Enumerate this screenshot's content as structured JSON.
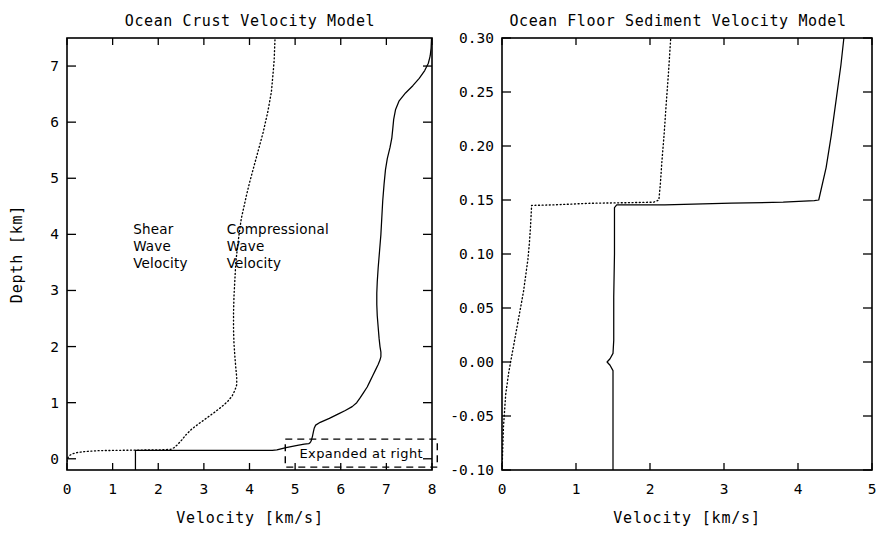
{
  "figure": {
    "background_color": "#ffffff",
    "ink_color": "#000000"
  },
  "chart_data": [
    {
      "id": "ocean-crust",
      "type": "line",
      "title": "Ocean Crust Velocity Model",
      "xlabel": "Velocity  [km/s]",
      "ylabel": "Depth  [km]",
      "xlim": [
        0,
        8
      ],
      "ylim": [
        7.5,
        -0.2
      ],
      "y_inverted": true,
      "grid": false,
      "legend_position": "in-plot-annotations",
      "xticks": [
        0,
        1,
        2,
        3,
        4,
        5,
        6,
        7,
        8
      ],
      "xtick_labels": [
        "0",
        "1",
        "2",
        "3",
        "4",
        "5",
        "6",
        "7",
        "8"
      ],
      "yticks": [
        0,
        1,
        2,
        3,
        4,
        5,
        6,
        7
      ],
      "ytick_labels": [
        "0",
        "1",
        "2",
        "3",
        "4",
        "5",
        "6",
        "7"
      ],
      "annotations": [
        {
          "name": "shear-wave-label",
          "text": "Shear\nWave\nVelocity",
          "x": 1.45,
          "y": 4.0
        },
        {
          "name": "compressional-wave-label",
          "text": "Compressional\nWave\nVelocity",
          "x": 3.5,
          "y": 4.0
        },
        {
          "name": "expanded-at-right-box",
          "text": "Expanded at right",
          "x": 6.45,
          "y": 0.1
        }
      ],
      "series": [
        {
          "name": "Compressional Wave Velocity",
          "style": "solid",
          "points": [
            [
              1.5,
              -0.2
            ],
            [
              1.5,
              0.15
            ],
            [
              4.5,
              0.15
            ],
            [
              4.6,
              0.16
            ],
            [
              4.8,
              0.2
            ],
            [
              5.05,
              0.24
            ],
            [
              5.2,
              0.26
            ],
            [
              5.3,
              0.27
            ],
            [
              5.32,
              0.28
            ],
            [
              5.34,
              0.3
            ],
            [
              5.36,
              0.34
            ],
            [
              5.38,
              0.4
            ],
            [
              5.4,
              0.48
            ],
            [
              5.42,
              0.55
            ],
            [
              5.45,
              0.6
            ],
            [
              5.55,
              0.65
            ],
            [
              5.75,
              0.72
            ],
            [
              5.95,
              0.8
            ],
            [
              6.1,
              0.86
            ],
            [
              6.25,
              0.93
            ],
            [
              6.35,
              1.0
            ],
            [
              6.42,
              1.08
            ],
            [
              6.5,
              1.18
            ],
            [
              6.58,
              1.28
            ],
            [
              6.64,
              1.38
            ],
            [
              6.7,
              1.48
            ],
            [
              6.76,
              1.58
            ],
            [
              6.82,
              1.68
            ],
            [
              6.86,
              1.76
            ],
            [
              6.88,
              1.82
            ],
            [
              6.88,
              1.9
            ],
            [
              6.86,
              2.0
            ],
            [
              6.84,
              2.15
            ],
            [
              6.82,
              2.35
            ],
            [
              6.8,
              2.55
            ],
            [
              6.79,
              2.75
            ],
            [
              6.79,
              2.95
            ],
            [
              6.8,
              3.15
            ],
            [
              6.82,
              3.4
            ],
            [
              6.85,
              3.7
            ],
            [
              6.88,
              4.0
            ],
            [
              6.9,
              4.3
            ],
            [
              6.92,
              4.6
            ],
            [
              6.95,
              4.9
            ],
            [
              6.98,
              5.15
            ],
            [
              7.02,
              5.35
            ],
            [
              7.08,
              5.55
            ],
            [
              7.12,
              5.72
            ],
            [
              7.14,
              5.88
            ],
            [
              7.16,
              6.05
            ],
            [
              7.2,
              6.22
            ],
            [
              7.28,
              6.38
            ],
            [
              7.42,
              6.52
            ],
            [
              7.58,
              6.65
            ],
            [
              7.72,
              6.78
            ],
            [
              7.84,
              6.92
            ],
            [
              7.92,
              7.05
            ],
            [
              7.96,
              7.18
            ],
            [
              7.98,
              7.32
            ],
            [
              7.99,
              7.5
            ]
          ]
        },
        {
          "name": "Shear Wave Velocity",
          "style": "dotted",
          "points": [
            [
              0.0,
              -0.05
            ],
            [
              0.02,
              0.02
            ],
            [
              0.06,
              0.06
            ],
            [
              0.12,
              0.09
            ],
            [
              0.22,
              0.11
            ],
            [
              0.4,
              0.13
            ],
            [
              0.7,
              0.145
            ],
            [
              1.1,
              0.15
            ],
            [
              1.6,
              0.155
            ],
            [
              2.1,
              0.16
            ],
            [
              2.28,
              0.17
            ],
            [
              2.35,
              0.2
            ],
            [
              2.42,
              0.25
            ],
            [
              2.5,
              0.32
            ],
            [
              2.6,
              0.42
            ],
            [
              2.72,
              0.52
            ],
            [
              2.88,
              0.62
            ],
            [
              3.05,
              0.72
            ],
            [
              3.22,
              0.82
            ],
            [
              3.38,
              0.92
            ],
            [
              3.52,
              1.02
            ],
            [
              3.62,
              1.12
            ],
            [
              3.68,
              1.22
            ],
            [
              3.72,
              1.32
            ],
            [
              3.72,
              1.45
            ],
            [
              3.7,
              1.62
            ],
            [
              3.68,
              1.82
            ],
            [
              3.66,
              2.05
            ],
            [
              3.65,
              2.3
            ],
            [
              3.65,
              2.6
            ],
            [
              3.66,
              2.9
            ],
            [
              3.68,
              3.2
            ],
            [
              3.7,
              3.5
            ],
            [
              3.74,
              3.8
            ],
            [
              3.78,
              4.05
            ],
            [
              3.82,
              4.28
            ],
            [
              3.88,
              4.5
            ],
            [
              3.94,
              4.72
            ],
            [
              4.0,
              4.92
            ],
            [
              4.06,
              5.1
            ],
            [
              4.12,
              5.28
            ],
            [
              4.18,
              5.46
            ],
            [
              4.24,
              5.64
            ],
            [
              4.3,
              5.82
            ],
            [
              4.35,
              6.0
            ],
            [
              4.4,
              6.18
            ],
            [
              4.44,
              6.36
            ],
            [
              4.48,
              6.54
            ],
            [
              4.5,
              6.72
            ],
            [
              4.52,
              6.9
            ],
            [
              4.54,
              7.1
            ],
            [
              4.55,
              7.3
            ],
            [
              4.56,
              7.5
            ]
          ]
        }
      ]
    },
    {
      "id": "ocean-floor-sediment",
      "type": "line",
      "title": "Ocean Floor Sediment Velocity Model",
      "xlabel": "Velocity  [km/s]",
      "ylabel": "",
      "xlim": [
        0,
        5
      ],
      "ylim": [
        0.3,
        -0.1
      ],
      "y_inverted": true,
      "grid": false,
      "legend_position": "none",
      "xticks": [
        0,
        1,
        2,
        3,
        4,
        5
      ],
      "xtick_labels": [
        "0",
        "1",
        "2",
        "3",
        "4",
        "5"
      ],
      "yticks": [
        -0.1,
        -0.05,
        0.0,
        0.05,
        0.1,
        0.15,
        0.2,
        0.25,
        0.3
      ],
      "ytick_labels": [
        "-0.10",
        "-0.05",
        "0.00",
        "0.05",
        "0.10",
        "0.15",
        "0.20",
        "0.25",
        "0.30"
      ],
      "annotations": [],
      "series": [
        {
          "name": "Compressional Wave Velocity",
          "style": "solid",
          "points": [
            [
              1.5,
              -0.1
            ],
            [
              1.5,
              -0.008
            ],
            [
              1.46,
              -0.003
            ],
            [
              1.42,
              0.0
            ],
            [
              1.46,
              0.003
            ],
            [
              1.5,
              0.008
            ],
            [
              1.51,
              0.02
            ],
            [
              1.51,
              0.06
            ],
            [
              1.52,
              0.1
            ],
            [
              1.52,
              0.143
            ],
            [
              1.55,
              0.1455
            ],
            [
              2.2,
              0.1455
            ],
            [
              3.1,
              0.147
            ],
            [
              3.8,
              0.148
            ],
            [
              4.22,
              0.1495
            ],
            [
              4.28,
              0.15
            ],
            [
              4.38,
              0.18
            ],
            [
              4.45,
              0.21
            ],
            [
              4.52,
              0.245
            ],
            [
              4.58,
              0.275
            ],
            [
              4.62,
              0.3
            ]
          ]
        },
        {
          "name": "Shear Wave Velocity",
          "style": "dotted",
          "points": [
            [
              0.0,
              -0.1
            ],
            [
              0.02,
              -0.06
            ],
            [
              0.05,
              -0.03
            ],
            [
              0.09,
              -0.01
            ],
            [
              0.13,
              0.005
            ],
            [
              0.17,
              0.02
            ],
            [
              0.21,
              0.035
            ],
            [
              0.25,
              0.05
            ],
            [
              0.29,
              0.065
            ],
            [
              0.32,
              0.08
            ],
            [
              0.35,
              0.095
            ],
            [
              0.37,
              0.11
            ],
            [
              0.385,
              0.125
            ],
            [
              0.395,
              0.138
            ],
            [
              0.4,
              0.145
            ],
            [
              0.7,
              0.1455
            ],
            [
              1.2,
              0.147
            ],
            [
              1.7,
              0.1475
            ],
            [
              2.05,
              0.148
            ],
            [
              2.12,
              0.15
            ],
            [
              2.14,
              0.165
            ],
            [
              2.16,
              0.185
            ],
            [
              2.19,
              0.21
            ],
            [
              2.22,
              0.24
            ],
            [
              2.25,
              0.268
            ],
            [
              2.28,
              0.3
            ]
          ]
        }
      ]
    }
  ]
}
